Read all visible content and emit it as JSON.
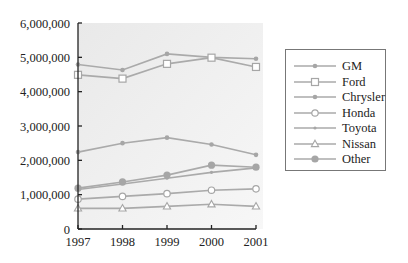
{
  "chart_data": {
    "type": "line",
    "title": "",
    "xlabel": "",
    "ylabel": "",
    "x": [
      "1997",
      "1998",
      "1999",
      "2000",
      "2001"
    ],
    "y_ticks": [
      "0",
      "1,000,000",
      "2,000,000",
      "3,000,000",
      "4,000,000",
      "5,000,000",
      "6,000,000"
    ],
    "ylim": [
      0,
      6000000
    ],
    "grid": false,
    "legend_position": "right",
    "series": [
      {
        "name": "GM",
        "marker": "dot-small",
        "values": [
          4790000,
          4630000,
          5100000,
          5000000,
          4960000
        ]
      },
      {
        "name": "Ford",
        "marker": "square-open",
        "values": [
          4490000,
          4380000,
          4810000,
          4990000,
          4720000
        ]
      },
      {
        "name": "Chrysler",
        "marker": "dot-small",
        "values": [
          2240000,
          2500000,
          2660000,
          2460000,
          2160000
        ]
      },
      {
        "name": "Honda",
        "marker": "circle-open",
        "values": [
          870000,
          950000,
          1030000,
          1130000,
          1170000
        ]
      },
      {
        "name": "Toyota",
        "marker": "dot-tiny",
        "values": [
          1150000,
          1310000,
          1480000,
          1650000,
          1780000
        ]
      },
      {
        "name": "Nissan",
        "marker": "triangle-open",
        "values": [
          600000,
          600000,
          660000,
          720000,
          660000
        ]
      },
      {
        "name": "Other",
        "marker": "dot-large",
        "values": [
          1190000,
          1370000,
          1570000,
          1860000,
          1800000
        ]
      }
    ]
  },
  "colors": {
    "line": "#aaaaaa",
    "marker": "#a6a6a6",
    "plot_bg_top": "#ececec",
    "plot_bg_bottom": "#f6f6f6",
    "axis": "#222222",
    "legend_border": "#777777"
  }
}
